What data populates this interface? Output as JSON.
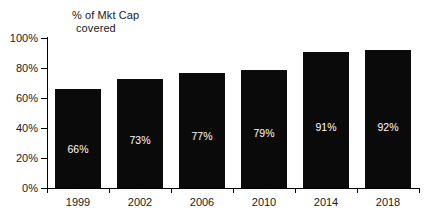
{
  "chart_data": {
    "type": "bar",
    "title": "% of Mkt Cap covered",
    "title_line1": "% of Mkt Cap",
    "title_line2": "covered",
    "xlabel": "",
    "ylabel": "",
    "categories": [
      "1999",
      "2002",
      "2006",
      "2010",
      "2014",
      "2018"
    ],
    "values": [
      66,
      73,
      77,
      79,
      91,
      92
    ],
    "value_labels": [
      "66%",
      "73%",
      "77%",
      "79%",
      "91%",
      "92%"
    ],
    "ylim": [
      0,
      100
    ],
    "yticks": [
      0,
      20,
      40,
      60,
      80,
      100
    ],
    "ytick_labels": [
      "0%",
      "20%",
      "40%",
      "60%",
      "80%",
      "100%"
    ],
    "grid": false,
    "legend": "none",
    "bar_color": "#0a0a0a",
    "label_color": "#ffffff",
    "axis_color": "#000000",
    "background": "#ffffff"
  }
}
